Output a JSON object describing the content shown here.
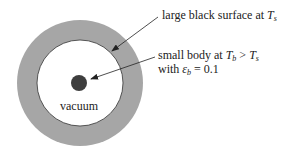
{
  "diagram": {
    "labels": {
      "surface": {
        "text": "large black surface at ",
        "var": "T",
        "sub": "s"
      },
      "body_line1": {
        "text": "small body at ",
        "var1": "T",
        "sub1": "b",
        "op": " > ",
        "var2": "T",
        "sub2": "s"
      },
      "body_line2": {
        "text": "with ",
        "var": "ε",
        "sub": "b",
        "rest": " = 0.1"
      },
      "vacuum": "vacuum"
    },
    "colors": {
      "surface_ring": "#a6a6a6",
      "inner_region": "#ffffff",
      "small_body": "#3e3e3e",
      "stroke": "#333333"
    },
    "elements": {
      "outer_circle": {
        "cx": 80,
        "cy": 83,
        "r": 63
      },
      "inner_circle": {
        "cx": 80,
        "cy": 83,
        "r": 43
      },
      "small_body": {
        "cx": 79,
        "cy": 83,
        "r": 8
      },
      "arrows": [
        {
          "name": "surface-pointer",
          "from": [
            158,
            17
          ],
          "to": [
            112,
            51
          ]
        },
        {
          "name": "body-pointer",
          "from": [
            155,
            57
          ],
          "to": [
            91,
            79
          ]
        }
      ]
    }
  }
}
